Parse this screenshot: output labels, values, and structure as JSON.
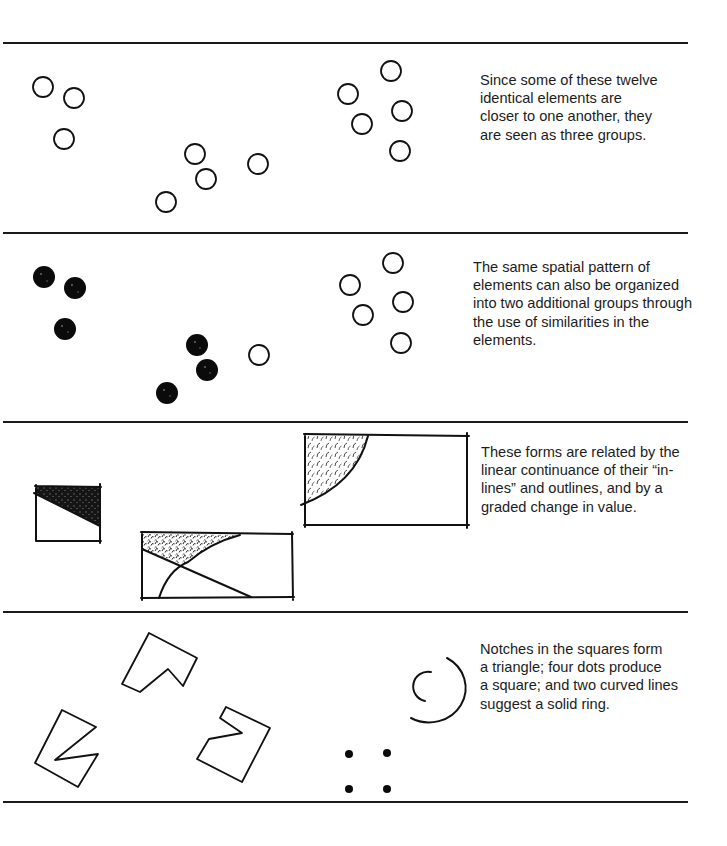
{
  "sections": [
    {
      "id": "proximity",
      "caption": "Since some of these twelve\nidentical elements are\ncloser to one another, they\nare seen as three groups."
    },
    {
      "id": "similarity",
      "caption": "The same spatial pattern of\nelements can also be organized\ninto two additional groups through\nthe use of similarities in the\nelements."
    },
    {
      "id": "continuance",
      "caption": "These forms are related by the\nlinear continuance of their “in-\nlines” and outlines, and by a\ngraded change in value."
    },
    {
      "id": "closure",
      "caption": "Notches in the squares form\na triangle; four dots produce\na square; and two curved lines\nsuggest a solid ring."
    }
  ],
  "figures": {
    "circle_icon": "open-circle",
    "filled_circle_icon": "filled-circle",
    "ink_color": "#111111",
    "divider_color": "#1a1a1a"
  }
}
